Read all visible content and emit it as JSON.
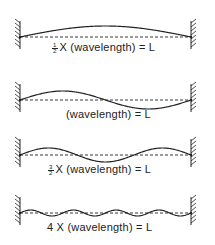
{
  "diagram": {
    "stroke_color": "#222222",
    "panels": [
      {
        "id": "p1",
        "multiplier_num": "1",
        "multiplier_den": "2",
        "label_rest": "X (wavelength) = L",
        "half_waves": 1,
        "baseline_y": 37,
        "amplitude": 11
      },
      {
        "id": "p2",
        "multiplier_num": "",
        "multiplier_den": "",
        "label_rest": "(wavelength) = L",
        "half_waves": 2,
        "baseline_y": 100,
        "amplitude": 9
      },
      {
        "id": "p3",
        "multiplier_num": "3",
        "multiplier_den": "2",
        "label_rest": "X (wavelength) = L",
        "half_waves": 3,
        "baseline_y": 155,
        "amplitude": 7
      },
      {
        "id": "p4",
        "multiplier_prefix": "4",
        "label_rest": "X (wavelength) = L",
        "half_waves": 8,
        "baseline_y": 213,
        "amplitude": 3
      }
    ]
  }
}
